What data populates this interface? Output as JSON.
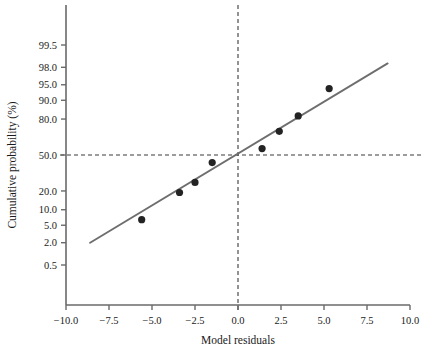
{
  "chart_data": {
    "type": "scatter",
    "title": "",
    "subtitle": "",
    "xlabel": "Model residuals",
    "ylabel": "Cumulative probability (%)",
    "xlim": [
      -10.0,
      10.0
    ],
    "ylim": [
      0.5,
      99.5
    ],
    "y_scale": "probit",
    "grid": false,
    "legend": null,
    "x_ticks": [
      "-10.0",
      "-7.5",
      "-5.0",
      "-2.5",
      "0.0",
      "2.5",
      "5.0",
      "7.5",
      "10.0"
    ],
    "x_tick_values": [
      -10.0,
      -7.5,
      -5.0,
      -2.5,
      0.0,
      2.5,
      5.0,
      7.5,
      10.0
    ],
    "y_ticks": [
      "99.5",
      "98.0",
      "95.0",
      "90.0",
      "80.0",
      "50.0",
      "20.0",
      "10.0",
      "5.0",
      "2.0",
      "0.5"
    ],
    "y_tick_values": [
      99.5,
      98.0,
      95.0,
      90.0,
      80.0,
      50.0,
      20.0,
      10.0,
      5.0,
      2.0,
      0.5
    ],
    "points": [
      {
        "x": -5.6,
        "y": 6.5
      },
      {
        "x": -3.4,
        "y": 19.0
      },
      {
        "x": -2.5,
        "y": 26.0
      },
      {
        "x": -1.5,
        "y": 43.0
      },
      {
        "x": 1.4,
        "y": 56.0
      },
      {
        "x": 2.4,
        "y": 71.0
      },
      {
        "x": 3.5,
        "y": 82.0
      },
      {
        "x": 5.3,
        "y": 94.0
      }
    ],
    "fit_line": {
      "name": "reference line",
      "x_start": -8.6,
      "y_start": 2.0,
      "x_end": 8.7,
      "y_end": 98.4,
      "color": "#6e6e6e"
    },
    "reference_lines": [
      {
        "name": "50% horizontal",
        "orientation": "horizontal",
        "value": 50.0,
        "style": "dashed",
        "color": "#3a3a3a"
      },
      {
        "name": "zero vertical",
        "orientation": "vertical",
        "value": 0.0,
        "style": "dashed",
        "color": "#3a3a3a"
      }
    ],
    "marker": {
      "shape": "circle",
      "color": "#232323",
      "size_px": 6
    },
    "axis_color": "#6a6a6a"
  },
  "annotations": {
    "x_axis_title": "Model residuals",
    "y_axis_title": "Cumulative probability (%)"
  }
}
